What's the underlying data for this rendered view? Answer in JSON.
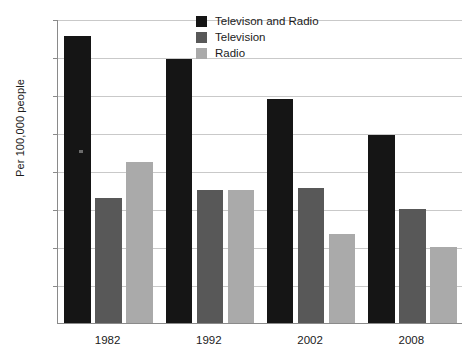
{
  "chart_data": {
    "type": "bar",
    "title": "",
    "subtitle": "",
    "xlabel": "",
    "ylabel": "Per 100,000 people",
    "categories": [
      "1982",
      "1992",
      "2002",
      "2008"
    ],
    "series": [
      {
        "name": "Televison and Radio",
        "color": "#151515",
        "values": [
          0.151,
          0.139,
          0.118,
          0.099
        ]
      },
      {
        "name": "Television",
        "color": "#585858",
        "values": [
          0.066,
          0.07,
          0.071,
          0.06
        ]
      },
      {
        "name": "Radio",
        "color": "#aaaaaa",
        "values": [
          0.085,
          0.07,
          0.047,
          0.04
        ]
      }
    ],
    "ylim": [
      0,
      0.16
    ],
    "yticks": [
      0.02,
      0.04,
      0.06,
      0.08,
      0.1,
      0.12,
      0.14,
      0.16
    ],
    "ytick_labels": [
      "0.02",
      "0.04",
      "0.06",
      "0.08",
      "0.10",
      "0.12",
      "0.14",
      "0.16"
    ],
    "grid": true,
    "grid_axis": "y",
    "legend_position": "top-center",
    "legend_entries": [
      "Televison and Radio",
      "Television",
      "Radio"
    ],
    "annotations": []
  }
}
